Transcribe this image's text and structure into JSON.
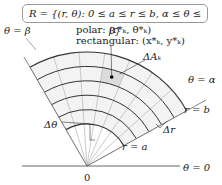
{
  "set_definition": "R = {(r, θ): 0 ≤ a ≤ r ≤ b, α ≤ θ ≤ β}",
  "labels": {
    "theta_beta": "θ = β",
    "theta_alpha": "θ = α",
    "theta_zero": "θ = 0",
    "polar": "polar: (r*ₖ, θ*ₖ)",
    "rectangular": "rectangular: (x*ₖ, y*ₖ)",
    "delta_a": "ΔAₖ",
    "r_b": "r = b",
    "r_a": "r = a",
    "delta_theta": "Δθ",
    "delta_r": "Δr",
    "origin": "0"
  },
  "colors": {
    "shade": "#e2e2e2",
    "line": "#444",
    "grid": "#999"
  }
}
